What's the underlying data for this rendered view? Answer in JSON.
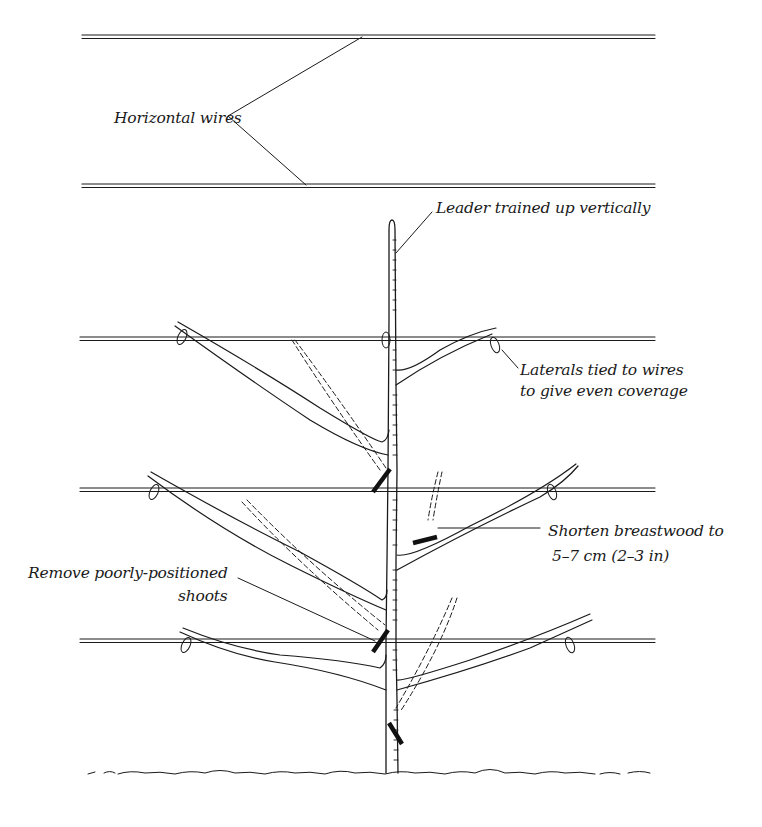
{
  "diagram": {
    "type": "espalier-training-illustration",
    "colors": {
      "ink": "#1a1a1a",
      "background": "#ffffff"
    },
    "labels": {
      "horizontal_wires": "Horizontal wires",
      "leader": "Leader trained up vertically",
      "laterals_line1": "Laterals tied to wires",
      "laterals_line2": "to give even coverage",
      "breastwood_line1": "Shorten breastwood to",
      "breastwood_line2": "5–7 cm (2–3 in)",
      "remove_line1": "Remove poorly-positioned",
      "remove_line2": "shoots"
    },
    "wires": [
      {
        "name": "top-wire-1",
        "y": 37
      },
      {
        "name": "top-wire-2",
        "y": 186
      },
      {
        "name": "tier-wire-1",
        "y": 339
      },
      {
        "name": "tier-wire-2",
        "y": 490
      },
      {
        "name": "tier-wire-3",
        "y": 641
      }
    ],
    "cut_marks": 4,
    "ground_line_y": 773
  }
}
